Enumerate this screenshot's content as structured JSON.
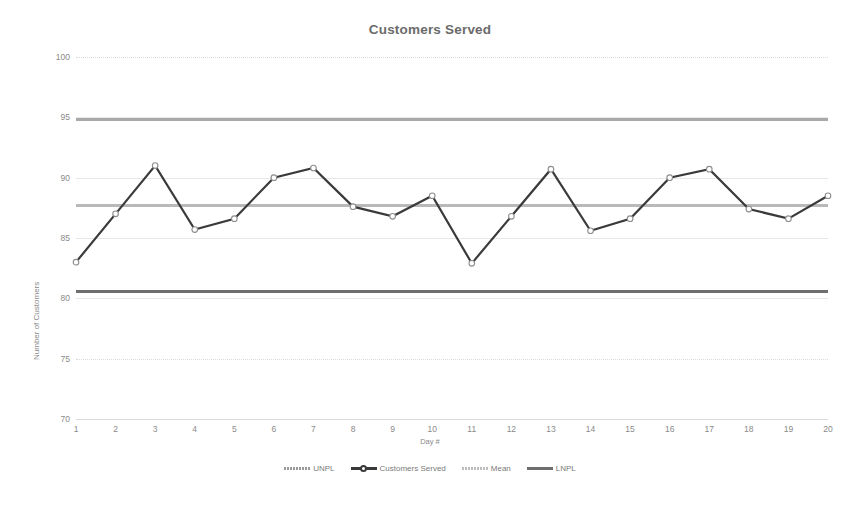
{
  "chart_data": {
    "type": "line",
    "title": "Customers Served",
    "xlabel": "Day #",
    "ylabel": "Number of Customers",
    "x": [
      1,
      2,
      3,
      4,
      5,
      6,
      7,
      8,
      9,
      10,
      11,
      12,
      13,
      14,
      15,
      16,
      17,
      18,
      19,
      20
    ],
    "xticklabels": [
      "1",
      "2",
      "3",
      "4",
      "5",
      "6",
      "7",
      "8",
      "9",
      "10",
      "11",
      "12",
      "13",
      "14",
      "15",
      "16",
      "17",
      "18",
      "19",
      "20"
    ],
    "yticks": [
      70,
      75,
      80,
      85,
      90,
      95,
      100
    ],
    "yticklabels": [
      "70",
      "75",
      "80",
      "85",
      "90",
      "95",
      "100"
    ],
    "ylim": [
      70,
      100
    ],
    "xlim": [
      1,
      20
    ],
    "grid": true,
    "legend_position": "bottom",
    "series": [
      {
        "name": "UNPL",
        "type": "constant-line",
        "value": 94.9,
        "color": "#9a9a9a",
        "style": "dotted-thick"
      },
      {
        "name": "Customers Served",
        "type": "line-marker",
        "color": "#3a3a3a",
        "marker": "open-circle",
        "values": [
          83,
          87,
          91,
          85.7,
          86.6,
          90,
          90.8,
          87.6,
          86.8,
          88.5,
          82.9,
          86.8,
          90.7,
          85.6,
          86.6,
          90,
          90.7,
          87.4,
          86.6,
          88.5
        ]
      },
      {
        "name": "Mean",
        "type": "constant-line",
        "value": 87.75,
        "color": "#bdbdbd",
        "style": "dotted-thick"
      },
      {
        "name": "LNPL",
        "type": "constant-line",
        "value": 80.6,
        "color": "#6f6f6f",
        "style": "solid-thick"
      }
    ],
    "legend": [
      "UNPL",
      "Customers Served",
      "Mean",
      "LNPL"
    ]
  },
  "colors": {
    "background": "#ffffff",
    "text": "#7a7a7a",
    "title": "#6b6b6b",
    "grid": "#e4e4e4",
    "series": "#3a3a3a",
    "unpl": "#9a9a9a",
    "mean": "#bdbdbd",
    "lnpl": "#6f6f6f"
  }
}
